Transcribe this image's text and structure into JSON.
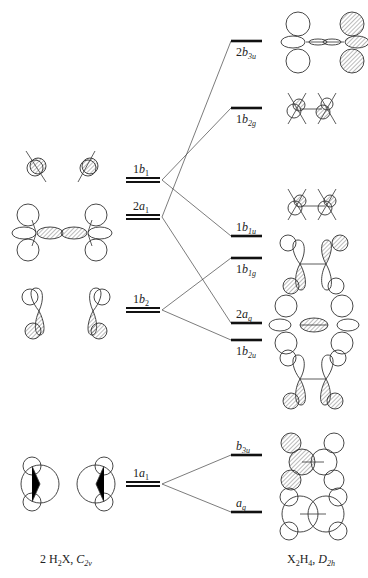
{
  "diagram": {
    "title_left": {
      "main": "2 H",
      "sub1": "2",
      "mid": "X, ",
      "ital": "C",
      "sub2": "2v"
    },
    "title_right": {
      "main": "X",
      "sub1": "2",
      "mid": "H",
      "sub2": "4",
      "sep": ", ",
      "ital": "D",
      "sub3": "2h"
    },
    "fragment_levels": [
      {
        "id": "1b1",
        "num": "1",
        "sym": "b",
        "sub": "1",
        "y": 180
      },
      {
        "id": "2a1",
        "num": "2",
        "sym": "a",
        "sub": "1",
        "y": 217
      },
      {
        "id": "1b2",
        "num": "1",
        "sym": "b",
        "sub": "2",
        "y": 310
      },
      {
        "id": "1a1",
        "num": "1",
        "sym": "a",
        "sub": "1",
        "y": 484
      }
    ],
    "molecule_levels": [
      {
        "id": "2b3u",
        "num": "2",
        "sym": "b",
        "sub": "3u",
        "y": 41,
        "label_pos": "below"
      },
      {
        "id": "1b2g",
        "num": "1",
        "sym": "b",
        "sub": "2g",
        "y": 108,
        "label_pos": "below"
      },
      {
        "id": "1b1u",
        "num": "1",
        "sym": "b",
        "sub": "1u",
        "y": 236,
        "label_pos": "above"
      },
      {
        "id": "1b1g",
        "num": "1",
        "sym": "b",
        "sub": "1g",
        "y": 258,
        "label_pos": "below"
      },
      {
        "id": "2ag",
        "num": "2",
        "sym": "a",
        "sub": "g",
        "y": 323,
        "label_pos": "above"
      },
      {
        "id": "1b2u",
        "num": "1",
        "sym": "b",
        "sub": "2u",
        "y": 340,
        "label_pos": "below"
      },
      {
        "id": "b3u",
        "num": "",
        "sym": "b",
        "sub": "3u",
        "y": 455,
        "label_pos": "above"
      },
      {
        "id": "ag",
        "num": "",
        "sym": "a",
        "sub": "g",
        "y": 512,
        "label_pos": "above"
      }
    ],
    "correlations": [
      {
        "from": "1b1",
        "to": "1b2g"
      },
      {
        "from": "1b1",
        "to": "1b1u"
      },
      {
        "from": "2a1",
        "to": "2b3u"
      },
      {
        "from": "2a1",
        "to": "2ag"
      },
      {
        "from": "1b2",
        "to": "1b1g"
      },
      {
        "from": "1b2",
        "to": "1b2u"
      },
      {
        "from": "1a1",
        "to": "b3u"
      },
      {
        "from": "1a1",
        "to": "ag"
      }
    ],
    "colors": {
      "line": "#111111",
      "hatch": "#555555",
      "background": "#ffffff"
    }
  }
}
